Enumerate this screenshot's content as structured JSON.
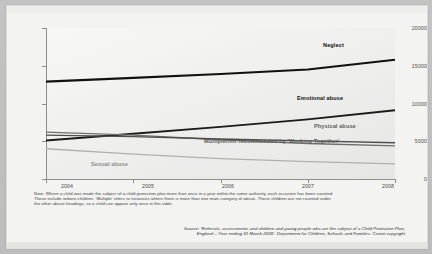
{
  "chart_data": {
    "type": "line",
    "title": "",
    "xlabel": "",
    "ylabel": "",
    "x": [
      2004,
      2005,
      2006,
      2007,
      2008
    ],
    "categories": [
      "2004",
      "2005",
      "2006",
      "2007",
      "2008"
    ],
    "xtick_labels": [
      "2004",
      "2005",
      "2006",
      "2007",
      "2008"
    ],
    "ytick_labels": [
      "0",
      "5000",
      "10000",
      "15000",
      "20000"
    ],
    "ytick_values": [
      0,
      5000,
      10000,
      15000,
      20000
    ],
    "ylim": [
      0,
      20000
    ],
    "xlim": [
      2004,
      2008
    ],
    "grid": false,
    "legend": "inline-end-of-line-labels",
    "series": [
      {
        "name": "Neglect",
        "label": "Neglect",
        "color": "#111111",
        "width": 1.9,
        "values": [
          12900,
          13400,
          13900,
          14500,
          15800
        ]
      },
      {
        "name": "Emotional abuse",
        "label": "Emotional abuse",
        "color": "#1a1a1a",
        "width": 1.7,
        "values": [
          5100,
          6000,
          6900,
          7900,
          9100
        ]
      },
      {
        "name": "Physical abuse",
        "label": "Physical abuse",
        "color": "#6e6e6c",
        "width": 1.2,
        "values": [
          6200,
          5800,
          5200,
          4700,
          4400
        ]
      },
      {
        "name": "Multiple/not recommended by 'Working Together'",
        "label": "Multiple/not recommended by 'Working Together'",
        "color": "#4d4d4b",
        "width": 1.2,
        "values": [
          5800,
          5600,
          5300,
          5050,
          4800
        ]
      },
      {
        "name": "Sexual abuse",
        "label": "Sexual abuse",
        "color": "#b0b0ae",
        "width": 1.3,
        "values": [
          4000,
          3300,
          2700,
          2300,
          2000
        ]
      }
    ]
  },
  "notes": {
    "line1": "Note: Where a child was made the subject of a child protection plan more than once in a year within the same authority, each occasion has been counted.",
    "line2": "These include unborn children.  'Multiple' refers to instances where there is more than one main category of abuse. These children are not counted under",
    "line3": "the other abuse headings, so a child can appear only once in this table."
  },
  "source": {
    "line1": "Source: 'Referrals, assessments and children and young people who are the subject of a Child Protection Plan,",
    "line2": "England – Year ending 31 March 2008'. Department for Children, Schools and Families. Crown copyright"
  }
}
